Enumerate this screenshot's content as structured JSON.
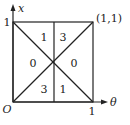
{
  "diagram": {
    "axes": {
      "x_axis_label": "θ",
      "y_axis_label": "x",
      "origin_label": "O",
      "x_tick_label": "1",
      "y_tick_label": "1"
    },
    "corner_label": "(1,1)",
    "regions": [
      {
        "id": "top-left",
        "label": "1"
      },
      {
        "id": "top-right",
        "label": "3"
      },
      {
        "id": "left",
        "label": "0"
      },
      {
        "id": "right",
        "label": "0"
      },
      {
        "id": "bottom-left",
        "label": "3"
      },
      {
        "id": "bottom-right",
        "label": "1"
      }
    ],
    "colors": {
      "stroke": "#222222",
      "background": "#ffffff"
    }
  }
}
